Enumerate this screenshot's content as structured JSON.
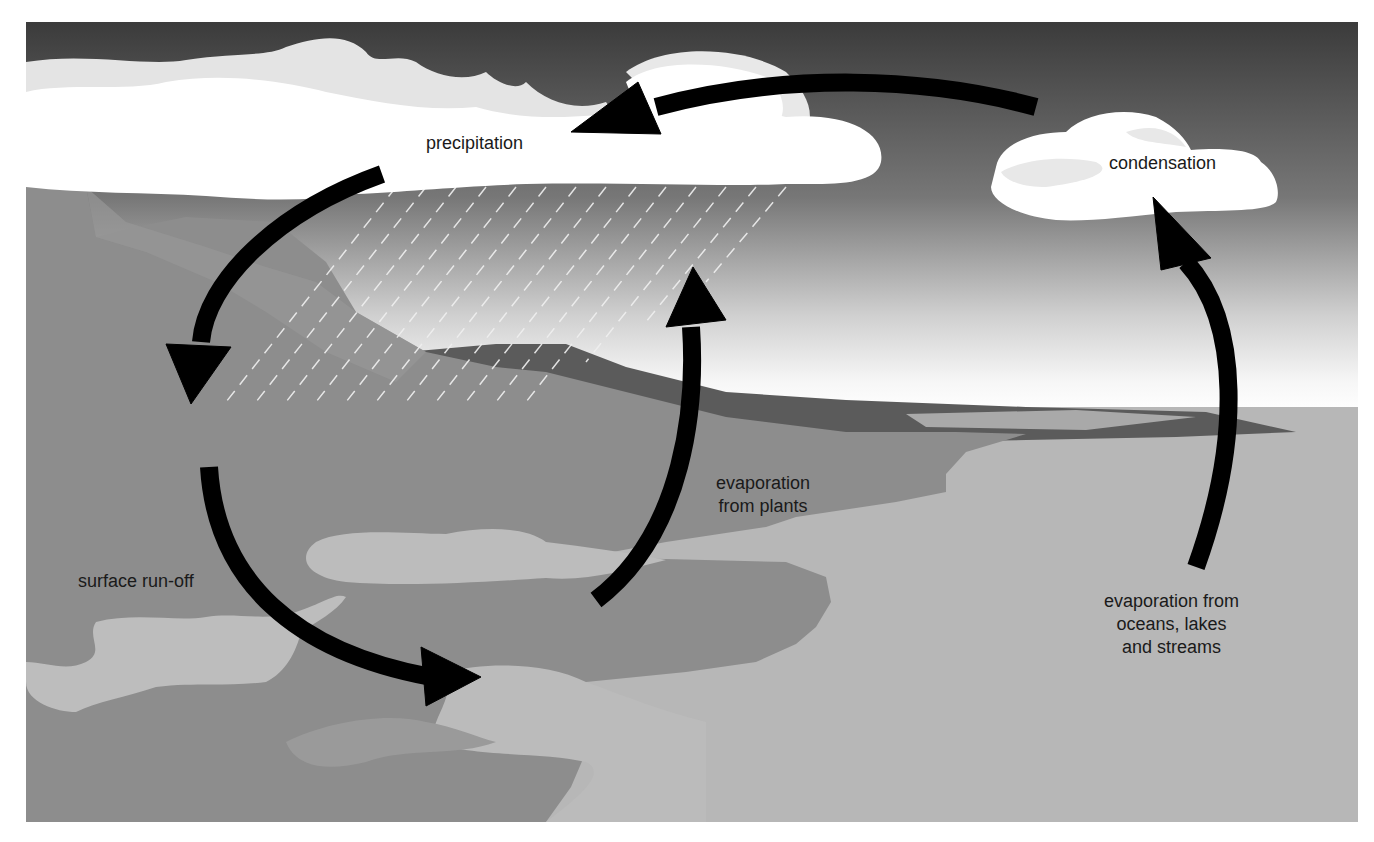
{
  "diagram": {
    "type": "water-cycle",
    "labels": {
      "precipitation": "precipitation",
      "condensation": "condensation",
      "surface_runoff": "surface run-off",
      "evaporation_plants_line1": "evaporation",
      "evaporation_plants_line2": "from plants",
      "evaporation_oceans_line1": "evaporation from",
      "evaporation_oceans_line2": "oceans, lakes",
      "evaporation_oceans_line3": "and streams"
    },
    "arrows": [
      {
        "name": "condensation-to-precipitation",
        "from": "condensation",
        "to": "precipitation"
      },
      {
        "name": "precipitation-to-land",
        "from": "precipitation",
        "to": "land"
      },
      {
        "name": "surface-runoff",
        "from": "land",
        "to": "water"
      },
      {
        "name": "evaporation-from-plants",
        "from": "plants",
        "to": "cloud"
      },
      {
        "name": "evaporation-from-oceans",
        "from": "oceans",
        "to": "condensation"
      }
    ],
    "colors": {
      "sky_top": "#3d3d3d",
      "sky_horizon": "#f4f4f4",
      "land": "#8c8c8c",
      "land_dark": "#5a5a5a",
      "water": "#b9b9b9",
      "cloud": "#ffffff",
      "cloud_shade": "#e6e6e6",
      "arrow": "#000000",
      "text": "#1a1a1a"
    }
  }
}
